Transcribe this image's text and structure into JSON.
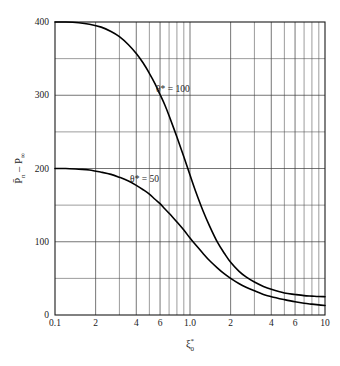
{
  "chart_data": {
    "type": "line",
    "title": "",
    "subtitle": "",
    "xlabel": "ξ₀*",
    "xlabel_base": "ξ",
    "xlabel_sub": "0",
    "xlabel_sup": "*",
    "ylabel": "P̄ₙ – P∞",
    "ylabel_part1": "P̄",
    "ylabel_part1_sub": "n",
    "ylabel_dash": "–",
    "ylabel_part2": "P",
    "ylabel_part2_sub": "∞",
    "xscale": "log",
    "yscale": "linear",
    "xlim": [
      0.1,
      10
    ],
    "ylim": [
      0,
      400
    ],
    "grid": true,
    "legend_position": "inline-annotations",
    "x_tick_labels": [
      "0.1",
      "2",
      "4",
      "6",
      "1.0",
      "2",
      "4",
      "6",
      "10"
    ],
    "x_tick_values": [
      0.1,
      0.2,
      0.4,
      0.6,
      1.0,
      2,
      4,
      6,
      10
    ],
    "x_minor_values": [
      0.3,
      0.5,
      0.7,
      0.8,
      0.9,
      3,
      5,
      7,
      8,
      9
    ],
    "y_tick_labels": [
      "0",
      "100",
      "200",
      "300",
      "400"
    ],
    "y_tick_values": [
      0,
      100,
      200,
      300,
      400
    ],
    "y_minor_values": [
      50,
      150,
      250,
      350
    ],
    "y_major_step": 100,
    "y_minor_step": 50,
    "annotations": [
      {
        "text": "θ* = 100",
        "x_data": 0.56,
        "y_data": 305,
        "series": "theta-100"
      },
      {
        "text": "θ* = 50",
        "x_data": 0.36,
        "y_data": 182,
        "series": "theta-50"
      }
    ],
    "series": [
      {
        "name": "θ* = 100",
        "label": "θ* = 100",
        "color": "#000000",
        "plateau": 400,
        "tail": 25,
        "x": [
          0.1,
          0.12,
          0.15,
          0.18,
          0.22,
          0.26,
          0.3,
          0.35,
          0.4,
          0.45,
          0.5,
          0.55,
          0.6,
          0.65,
          0.7,
          0.8,
          0.9,
          1.0,
          1.1,
          1.25,
          1.4,
          1.6,
          1.8,
          2.0,
          2.3,
          2.6,
          3.0,
          3.5,
          4.0,
          5.0,
          6.0,
          7.0,
          8.0,
          9.0,
          10.0
        ],
        "values": [
          400,
          400,
          399,
          397,
          393,
          387,
          380,
          369,
          357,
          344,
          330,
          316,
          301,
          287,
          272,
          243,
          216,
          191,
          169,
          142,
          121,
          99,
          84,
          72,
          60,
          52,
          45,
          39,
          35,
          30,
          28,
          26.5,
          25.8,
          25.2,
          25
        ]
      },
      {
        "name": "θ* = 50",
        "label": "θ* = 50",
        "color": "#000000",
        "plateau": 200,
        "tail": 13,
        "x": [
          0.1,
          0.12,
          0.15,
          0.18,
          0.22,
          0.26,
          0.3,
          0.35,
          0.4,
          0.45,
          0.5,
          0.55,
          0.6,
          0.65,
          0.7,
          0.8,
          0.9,
          1.0,
          1.1,
          1.25,
          1.4,
          1.6,
          1.8,
          2.0,
          2.3,
          2.6,
          3.0,
          3.5,
          4.0,
          5.0,
          6.0,
          7.0,
          8.0,
          9.0,
          10.0
        ],
        "values": [
          200,
          200,
          199,
          198,
          195,
          192,
          188,
          183,
          177,
          171,
          165,
          158,
          152,
          145,
          139,
          127,
          116,
          105,
          96,
          84,
          74,
          64,
          56,
          50,
          43,
          38,
          33,
          28,
          25,
          21,
          18,
          16,
          14.8,
          13.8,
          13
        ]
      }
    ]
  },
  "plot_geometry": {
    "left": 55,
    "right": 325,
    "top": 22,
    "bottom": 315
  }
}
